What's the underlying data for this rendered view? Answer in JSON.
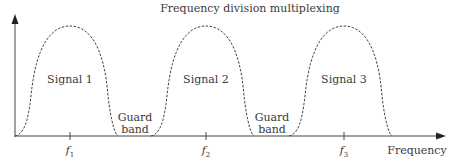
{
  "title": "Frequency division multiplexing",
  "x_axis_label": "Frequency",
  "signals": [
    {
      "label": "Signal 1",
      "center": "f",
      "sub": "1"
    },
    {
      "label": "Signal 2",
      "center": "f",
      "sub": "2"
    },
    {
      "label": "Signal 3",
      "center": "f",
      "sub": "3"
    }
  ],
  "guard_bands": [
    {
      "line1": "Guard",
      "line2": "band"
    },
    {
      "line1": "Guard",
      "line2": "band"
    }
  ],
  "colors": {
    "axis": "#444444",
    "curve": "#444444"
  }
}
